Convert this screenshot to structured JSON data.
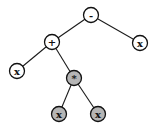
{
  "diagram": {
    "type": "expression-tree",
    "expression": "(x + (x * x)) - x",
    "colors": {
      "normal_fill": "#ffffff",
      "highlight_fill": "#b5b5b5",
      "stroke": "#111111"
    },
    "nodes": [
      {
        "id": "n-minus",
        "label": "-",
        "x": 91,
        "y": 15,
        "highlighted": false
      },
      {
        "id": "n-plus",
        "label": "+",
        "x": 52,
        "y": 42,
        "highlighted": false
      },
      {
        "id": "n-x-right",
        "label": "x",
        "x": 140,
        "y": 43,
        "highlighted": false
      },
      {
        "id": "n-x-left",
        "label": "x",
        "x": 17,
        "y": 71,
        "highlighted": false
      },
      {
        "id": "n-times",
        "label": "*",
        "x": 74,
        "y": 78,
        "highlighted": true
      },
      {
        "id": "n-x-bottom-left",
        "label": "x",
        "x": 59,
        "y": 114,
        "highlighted": true
      },
      {
        "id": "n-x-bottom-right",
        "label": "x",
        "x": 98,
        "y": 114,
        "highlighted": true
      }
    ],
    "edges": [
      {
        "from": "n-minus",
        "to": "n-plus"
      },
      {
        "from": "n-minus",
        "to": "n-x-right"
      },
      {
        "from": "n-plus",
        "to": "n-x-left"
      },
      {
        "from": "n-plus",
        "to": "n-times"
      },
      {
        "from": "n-times",
        "to": "n-x-bottom-left"
      },
      {
        "from": "n-times",
        "to": "n-x-bottom-right"
      }
    ]
  }
}
